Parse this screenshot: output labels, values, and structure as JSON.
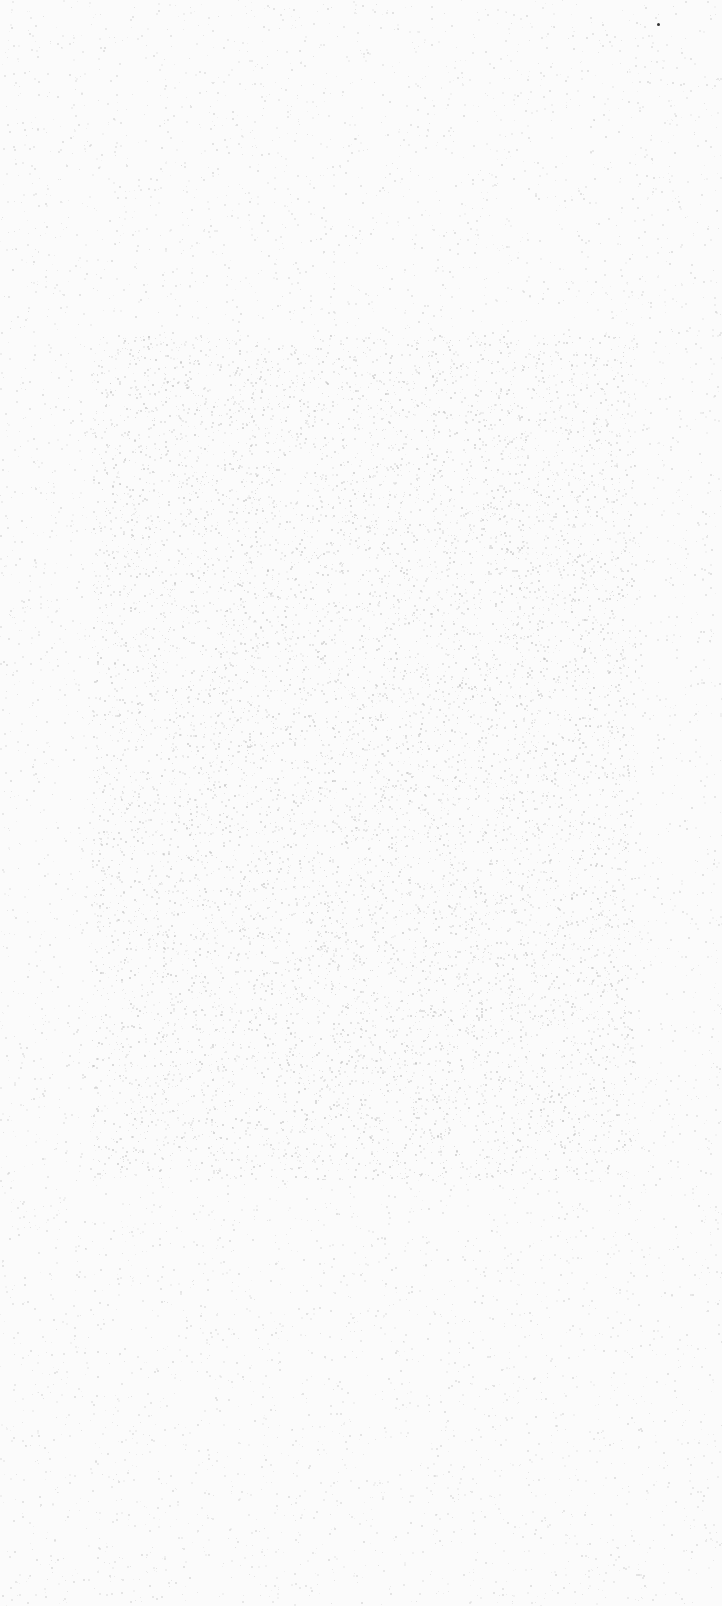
{
  "canvas": {
    "width": 722,
    "height": 1606,
    "background_color": "#fbfbfb",
    "noise_color": "#c8c8c8"
  },
  "panel": {
    "x": 92,
    "y": 335,
    "width": 544,
    "height": 845,
    "noise_color": "#b4b4b4",
    "noise_density": 0.35
  },
  "speck": {
    "x": 657,
    "y": 23,
    "color": "#333333"
  }
}
